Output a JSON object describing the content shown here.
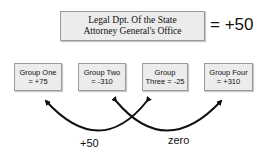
{
  "title_box": {
    "line1": "Legal Dpt. Of the State",
    "line2": "Attorney General's Office"
  },
  "total": "= +50",
  "groups": [
    {
      "line1": "Group One",
      "line2": "= +75"
    },
    {
      "line1": "Group Two",
      "line2": "= -310"
    },
    {
      "line1": "Group",
      "line2": "Three = -25"
    },
    {
      "line1": "Group Four",
      "line2": "= +310"
    }
  ],
  "arcs": [
    {
      "label": "+50",
      "from": "Group Two",
      "to": "Group One"
    },
    {
      "label": "zero",
      "from": "Group Three",
      "to": "Group Four"
    }
  ],
  "colors": {
    "box_fill": "#ececec",
    "box_border": "#9a9a9a",
    "arrow": "#111111"
  }
}
